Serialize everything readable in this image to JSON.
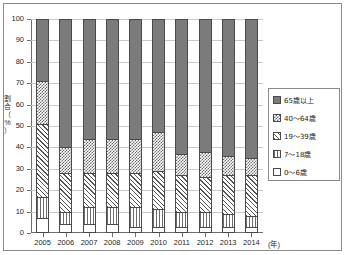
{
  "chart_data": {
    "type": "bar",
    "subtype": "100% stacked column",
    "title": "",
    "xlabel": "(年)",
    "ylabel": "割合（%）",
    "ylim": [
      0,
      100
    ],
    "ytick_step": 10,
    "yticks": [
      "0",
      "10",
      "20",
      "30",
      "40",
      "50",
      "60",
      "70",
      "80",
      "90",
      "100"
    ],
    "grid": true,
    "legend_position": "right",
    "categories": [
      "2005",
      "2006",
      "2007",
      "2008",
      "2009",
      "2010",
      "2011",
      "2012",
      "2013",
      "2014"
    ],
    "series": [
      {
        "name": "0～6歳",
        "pattern": "white",
        "values": [
          7,
          4,
          4,
          4,
          3,
          3,
          3,
          3,
          3,
          3
        ]
      },
      {
        "name": "7～18歳",
        "pattern": "vertical",
        "values": [
          10,
          6,
          8,
          8,
          9,
          8,
          7,
          7,
          6,
          5
        ]
      },
      {
        "name": "19～39歳",
        "pattern": "diagonal",
        "values": [
          34,
          18,
          16,
          16,
          16,
          18,
          17,
          16,
          18,
          19
        ]
      },
      {
        "name": "40～64歳",
        "pattern": "checker",
        "values": [
          20,
          12,
          16,
          16,
          16,
          18,
          10,
          12,
          9,
          8
        ]
      },
      {
        "name": "65歳以上",
        "pattern": "solid",
        "values": [
          29,
          60,
          56,
          56,
          56,
          53,
          63,
          62,
          64,
          65
        ]
      }
    ]
  },
  "axis": {
    "y_title_chars": [
      "割",
      "合",
      "（",
      "%",
      "）"
    ],
    "x_unit": "(年)"
  },
  "legend": {
    "items": [
      {
        "label": "65歳以上",
        "pattern": "solid"
      },
      {
        "label": "40～64歳",
        "pattern": "checker"
      },
      {
        "label": "19～39歳",
        "pattern": "diagonal"
      },
      {
        "label": "7～18歳",
        "pattern": "vertical"
      },
      {
        "label": "0～6歳",
        "pattern": "white"
      }
    ]
  }
}
